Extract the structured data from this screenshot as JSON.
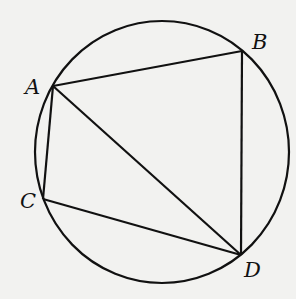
{
  "diagram": {
    "type": "circle with inscribed quadrilateral",
    "circle": {
      "cx": 162,
      "cy": 152,
      "rx": 127,
      "ry": 131
    },
    "points": {
      "A": {
        "label": "A",
        "x": 53,
        "y": 86,
        "lx": 25,
        "ly": 94
      },
      "B": {
        "label": "B",
        "x": 242,
        "y": 51,
        "lx": 252,
        "ly": 49
      },
      "C": {
        "label": "C",
        "x": 43,
        "y": 199,
        "lx": 20,
        "ly": 208
      },
      "D": {
        "label": "D",
        "x": 241,
        "y": 255,
        "lx": 244,
        "ly": 277
      }
    },
    "segments": [
      [
        "A",
        "B"
      ],
      [
        "B",
        "D"
      ],
      [
        "D",
        "C"
      ],
      [
        "C",
        "A"
      ],
      [
        "A",
        "D"
      ]
    ],
    "colors": {
      "stroke": "#111111",
      "background": "#f2f2f0"
    }
  }
}
